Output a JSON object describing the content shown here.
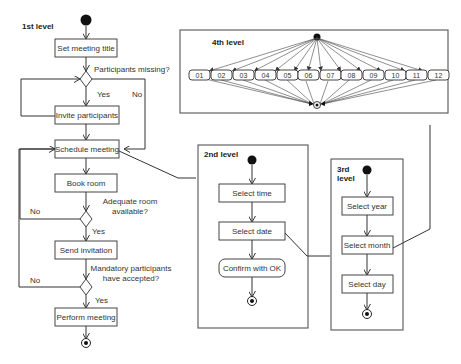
{
  "level1": {
    "title": "1st level",
    "activities": [
      {
        "id": "set_title",
        "label": "Set meeting title"
      },
      {
        "id": "invite",
        "label": "Invite participants"
      },
      {
        "id": "schedule",
        "label": "Schedule meeting"
      },
      {
        "id": "book",
        "label": "Book room"
      },
      {
        "id": "send",
        "label": "Send invitation"
      },
      {
        "id": "perform",
        "label": "Perform meeting"
      }
    ],
    "decisions": [
      {
        "question": "Participants missing?",
        "yes": "Yes",
        "no": "No"
      },
      {
        "question_line1": "Adequate room",
        "question_line2": "available?",
        "yes": "Yes",
        "no": "No"
      },
      {
        "question_line1": "Mandatory participants",
        "question_line2": "have accepted?",
        "yes": "Yes",
        "no": "No"
      }
    ]
  },
  "level2": {
    "title": "2nd level",
    "activities": [
      {
        "label": "Select time"
      },
      {
        "label": "Select date"
      },
      {
        "label": "Confirm with OK"
      }
    ]
  },
  "level3": {
    "title_line1": "3rd",
    "title_line2": "level",
    "activities": [
      {
        "label": "Select year"
      },
      {
        "label": "Select month"
      },
      {
        "label": "Select day"
      }
    ]
  },
  "level4": {
    "title": "4th level",
    "months": [
      "01",
      "02",
      "03",
      "04",
      "05",
      "06",
      "07",
      "08",
      "09",
      "10",
      "11",
      "12"
    ]
  },
  "colors": {
    "line": "#333333",
    "box_border": "#444444",
    "background": "#ffffff",
    "node": "#111111"
  }
}
